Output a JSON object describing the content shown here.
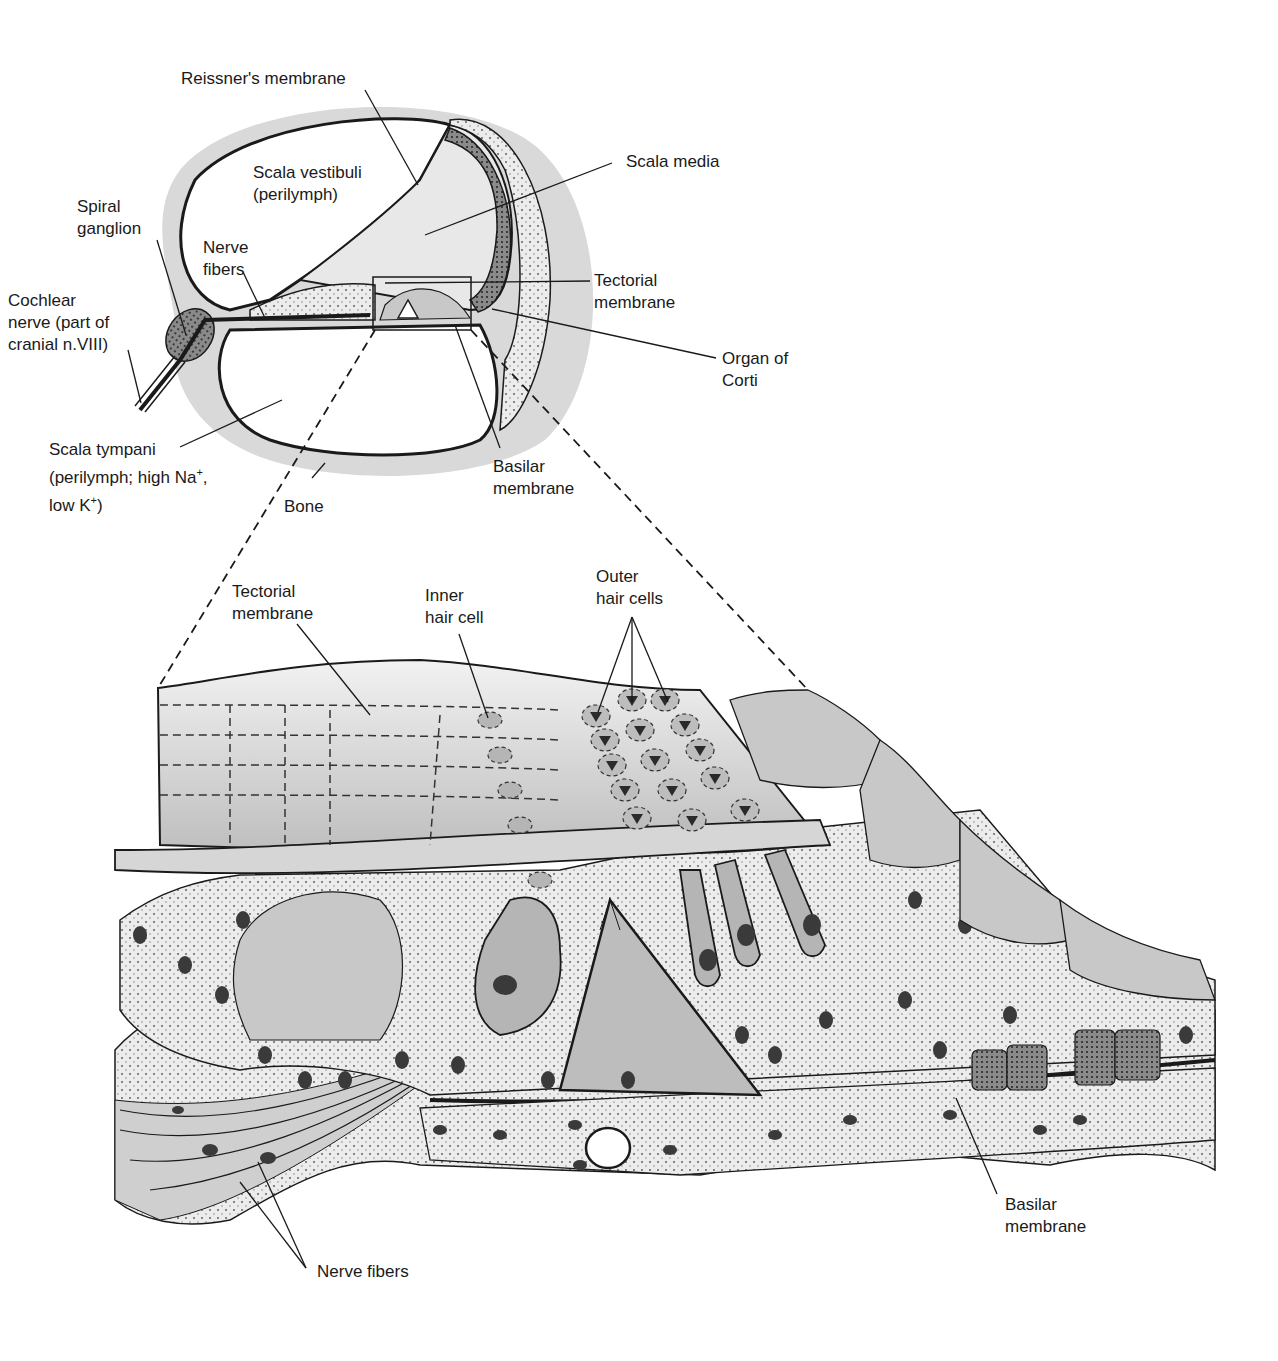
{
  "diagram": {
    "colors": {
      "bone": "#d9d9d9",
      "fill_light": "#ececec",
      "fill_mid": "#c8c8c8",
      "fill_dark": "#9a9a9a",
      "stroke": "#1a1a1a"
    },
    "top_view": {
      "labels": {
        "reissners_membrane": "Reissner's membrane",
        "scala_vestibuli_1": "Scala vestibuli",
        "scala_vestibuli_2": "(perilymph)",
        "scala_media": "Scala media",
        "spiral_ganglion_1": "Spiral",
        "spiral_ganglion_2": "ganglion",
        "nerve_fibers_1": "Nerve",
        "nerve_fibers_2": "fibers",
        "cochlear_nerve_1": "Cochlear",
        "cochlear_nerve_2": "nerve (part of",
        "cochlear_nerve_3": "cranial n.VIII)",
        "tectorial_membrane_1": "Tectorial",
        "tectorial_membrane_2": "membrane",
        "organ_of_corti_1": "Organ of",
        "organ_of_corti_2": "Corti",
        "scala_tympani_1": "Scala tympani",
        "scala_tympani_2a": "(perilymph; high Na",
        "scala_tympani_2sup": "+",
        "scala_tympani_2b": ",",
        "scala_tympani_3a": "low K",
        "scala_tympani_3sup": "+",
        "scala_tympani_3b": ")",
        "bone": "Bone",
        "basilar_membrane_1": "Basilar",
        "basilar_membrane_2": "membrane"
      }
    },
    "detail_view": {
      "labels": {
        "tectorial_membrane_1": "Tectorial",
        "tectorial_membrane_2": "membrane",
        "inner_hair_cell_1": "Inner",
        "inner_hair_cell_2": "hair cell",
        "outer_hair_cells_1": "Outer",
        "outer_hair_cells_2": "hair cells",
        "basilar_membrane_1": "Basilar",
        "basilar_membrane_2": "membrane",
        "nerve_fibers": "Nerve fibers"
      }
    }
  }
}
